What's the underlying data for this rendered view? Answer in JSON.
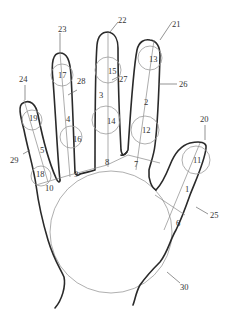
{
  "diagram": {
    "type": "hand measurement landmark diagram",
    "segment_labels": {
      "l1": "1",
      "l2": "2",
      "l3": "3",
      "l4": "4",
      "l5": "5",
      "l6": "6",
      "l7": "7",
      "l8": "8",
      "l9": "9",
      "l10": "10"
    },
    "circle_labels": {
      "c11": "11",
      "c12": "12",
      "c13": "13",
      "c14": "14",
      "c15": "15",
      "c16": "16",
      "c17": "17",
      "c18": "18",
      "c19": "19"
    },
    "callout_labels": {
      "c20": "20",
      "c21": "21",
      "c22": "22",
      "c23": "23",
      "c24": "24",
      "c25": "25",
      "c26": "26",
      "c27": "27",
      "c28": "28",
      "c29": "29",
      "c30": "30"
    },
    "colors": {
      "outline": "#2a2a2a",
      "guide": "#8a8a8a",
      "text": "#333333"
    }
  }
}
